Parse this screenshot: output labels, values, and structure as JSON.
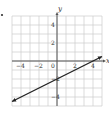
{
  "problem_marker": "•",
  "chart_data": {
    "type": "line",
    "title": "",
    "xlabel": "x",
    "ylabel": "y",
    "xlim": [
      -5,
      5
    ],
    "ylim": [
      -5,
      5
    ],
    "grid": true,
    "x_ticks": [
      "-4",
      "-2",
      "0",
      "2",
      "4"
    ],
    "y_ticks": [
      "4",
      "2",
      "-2",
      "-4"
    ],
    "series": [
      {
        "name": "y = 0.5x - 2",
        "x": [
          -5,
          5
        ],
        "y": [
          -4.5,
          0.5
        ],
        "arrows_both_ends": true
      }
    ],
    "colors": {
      "grid": "#cccccc",
      "axis": "#555555",
      "line": "#222222"
    }
  }
}
